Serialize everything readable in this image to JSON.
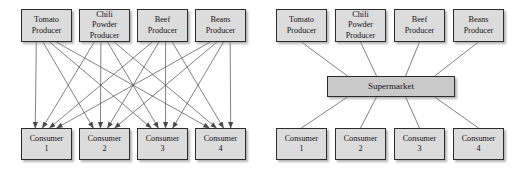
{
  "figure": {
    "type": "diagram",
    "subtype": "bipartite-network-vs-hub-and-spoke",
    "background_color": "#ffffff",
    "node_fill": "#dcdcdc",
    "hub_fill": "#c9c9c9",
    "node_border": "#2b2b2b",
    "edge_color": "#4a4a4a"
  },
  "panels": [
    {
      "id": "left",
      "name": "direct-producer-consumer-network",
      "edge_style": "arrow",
      "producers": [
        {
          "id": "p1",
          "label": "Tomato\nProducer",
          "x": 21,
          "y": 9,
          "w": 51,
          "h": 33
        },
        {
          "id": "p2",
          "label": "Chili\nPowder\nProducer",
          "x": 79,
          "y": 9,
          "w": 51,
          "h": 33
        },
        {
          "id": "p3",
          "label": "Beef\nProducer",
          "x": 137,
          "y": 9,
          "w": 51,
          "h": 33
        },
        {
          "id": "p4",
          "label": "Beans\nProducer",
          "x": 195,
          "y": 9,
          "w": 51,
          "h": 33
        }
      ],
      "consumers": [
        {
          "id": "c1",
          "label": "Consumer\n1",
          "x": 21,
          "y": 128,
          "w": 51,
          "h": 32
        },
        {
          "id": "c2",
          "label": "Consumer\n2",
          "x": 79,
          "y": 128,
          "w": 51,
          "h": 32
        },
        {
          "id": "c3",
          "label": "Consumer\n3",
          "x": 137,
          "y": 128,
          "w": 51,
          "h": 32
        },
        {
          "id": "c4",
          "label": "Consumer\n4",
          "x": 195,
          "y": 128,
          "w": 51,
          "h": 32
        }
      ],
      "links": [
        {
          "from": "p1",
          "to": "c1"
        },
        {
          "from": "p1",
          "to": "c2"
        },
        {
          "from": "p1",
          "to": "c3"
        },
        {
          "from": "p1",
          "to": "c4"
        },
        {
          "from": "p2",
          "to": "c1"
        },
        {
          "from": "p2",
          "to": "c2"
        },
        {
          "from": "p2",
          "to": "c3"
        },
        {
          "from": "p2",
          "to": "c4"
        },
        {
          "from": "p3",
          "to": "c1"
        },
        {
          "from": "p3",
          "to": "c2"
        },
        {
          "from": "p3",
          "to": "c3"
        },
        {
          "from": "p3",
          "to": "c4"
        },
        {
          "from": "p4",
          "to": "c1"
        },
        {
          "from": "p4",
          "to": "c2"
        },
        {
          "from": "p4",
          "to": "c3"
        },
        {
          "from": "p4",
          "to": "c4"
        }
      ]
    },
    {
      "id": "right",
      "name": "supermarket-intermediated-network",
      "edge_style": "plain",
      "producers": [
        {
          "id": "p1",
          "label": "Tomato\nProducer",
          "x": 15,
          "y": 9,
          "w": 51,
          "h": 33
        },
        {
          "id": "p2",
          "label": "Chili\nPowder\nProducer",
          "x": 74,
          "y": 9,
          "w": 51,
          "h": 33
        },
        {
          "id": "p3",
          "label": "Beef\nProducer",
          "x": 133,
          "y": 9,
          "w": 51,
          "h": 33
        },
        {
          "id": "p4",
          "label": "Beans\nProducer",
          "x": 192,
          "y": 9,
          "w": 51,
          "h": 33
        }
      ],
      "hub": {
        "id": "hub",
        "label": "Supermarket",
        "x": 66,
        "y": 76,
        "w": 128,
        "h": 21
      },
      "consumers": [
        {
          "id": "c1",
          "label": "Consumer\n1",
          "x": 15,
          "y": 128,
          "w": 51,
          "h": 32
        },
        {
          "id": "c2",
          "label": "Consumer\n2",
          "x": 74,
          "y": 128,
          "w": 51,
          "h": 32
        },
        {
          "id": "c3",
          "label": "Consumer\n3",
          "x": 133,
          "y": 128,
          "w": 51,
          "h": 32
        },
        {
          "id": "c4",
          "label": "Consumer\n4",
          "x": 192,
          "y": 128,
          "w": 51,
          "h": 32
        }
      ],
      "links": [
        {
          "from": "p1",
          "to": "hub"
        },
        {
          "from": "p2",
          "to": "hub"
        },
        {
          "from": "p3",
          "to": "hub"
        },
        {
          "from": "p4",
          "to": "hub"
        },
        {
          "from": "hub",
          "to": "c1"
        },
        {
          "from": "hub",
          "to": "c2"
        },
        {
          "from": "hub",
          "to": "c3"
        },
        {
          "from": "hub",
          "to": "c4"
        }
      ]
    }
  ]
}
